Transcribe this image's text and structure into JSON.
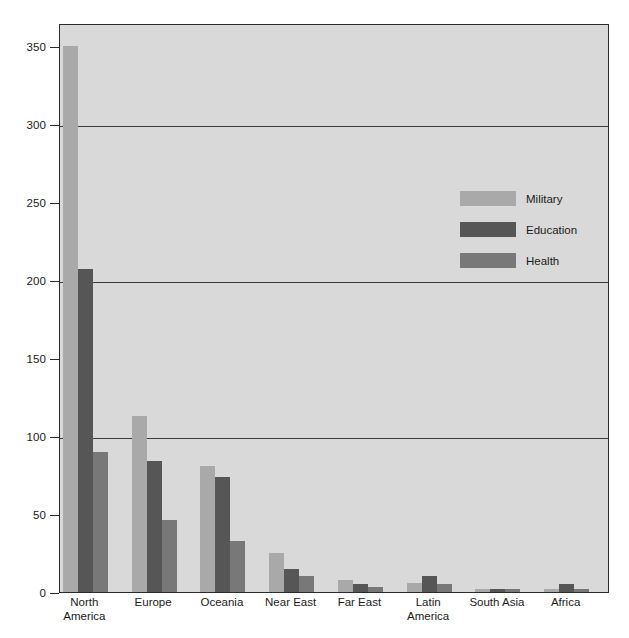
{
  "chart_data": {
    "type": "bar",
    "title": "",
    "subtitle": "",
    "xlabel": "",
    "ylabel": "",
    "ylim": [
      0,
      365
    ],
    "grid": true,
    "grid_axis": "y",
    "legend_position": "inside-upper-right",
    "categories": [
      "North America",
      "Europe",
      "Oceania",
      "Near East",
      "Far East",
      "Latin America",
      "South Asia",
      "Africa"
    ],
    "category_labels": [
      "North\nAmerica",
      "Europe",
      "Oceania",
      "Near East",
      "Far East",
      "Latin\nAmerica",
      "South Asia",
      "Africa"
    ],
    "yticks": [
      0,
      50,
      100,
      150,
      200,
      250,
      300,
      350
    ],
    "ytick_labels": [
      "0",
      "50",
      "100",
      "150",
      "200",
      "250",
      "300",
      "350"
    ],
    "gridline_values": [
      100,
      200,
      300
    ],
    "series": [
      {
        "name": "Military",
        "color": "#a9a9a9",
        "values": [
          350,
          113,
          81,
          25,
          8,
          6,
          2,
          2
        ]
      },
      {
        "name": "Education",
        "color": "#565656",
        "values": [
          207,
          84,
          74,
          15,
          5,
          10,
          2,
          5
        ]
      },
      {
        "name": "Health",
        "color": "#787878",
        "values": [
          90,
          46,
          33,
          10,
          3,
          5,
          2,
          2
        ]
      }
    ]
  },
  "legend": {
    "items": [
      {
        "label": "Military",
        "color": "#a9a9a9"
      },
      {
        "label": "Education",
        "color": "#565656"
      },
      {
        "label": "Health",
        "color": "#787878"
      }
    ]
  },
  "colors": {
    "plot_background": "#d9d9d9",
    "page_background": "#ffffff",
    "axis": "#2b2b2b",
    "gridline": "#3a3a3a",
    "text": "#1b1b1b"
  }
}
